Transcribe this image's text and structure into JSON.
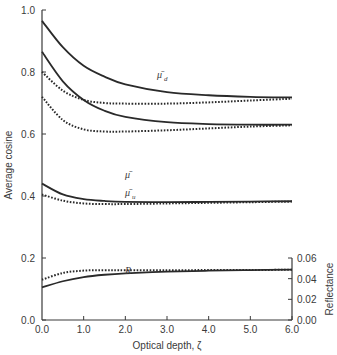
{
  "chart_data": {
    "type": "line",
    "title": "",
    "xlabel": "Optical depth, ζ",
    "ylabel": "Average cosine",
    "y2label": "Reflectance",
    "xlim": [
      0.0,
      6.0
    ],
    "ylim": [
      0.0,
      1.0
    ],
    "y2lim": [
      0.0,
      0.06
    ],
    "grid": false,
    "legend": "none (curves labeled inline)",
    "x_ticks": [
      "0.0",
      "1.0",
      "2.0",
      "3.0",
      "4.0",
      "5.0",
      "6.0"
    ],
    "y_ticks": [
      "0.0",
      "0.2",
      "0.4",
      "0.6",
      "0.8",
      "1.0"
    ],
    "y2_ticks": [
      "0.00",
      "0.02",
      "0.04",
      "0.06"
    ],
    "x": [
      0.0,
      0.5,
      1.0,
      1.5,
      2.0,
      3.0,
      4.0,
      5.0,
      6.0
    ],
    "series": [
      {
        "name": "μ̄d (solid)",
        "axis": "left",
        "style": "solid",
        "values": [
          0.965,
          0.88,
          0.82,
          0.785,
          0.76,
          0.735,
          0.725,
          0.72,
          0.718
        ]
      },
      {
        "name": "μ̄d (dotted)",
        "axis": "left",
        "style": "dotted",
        "values": [
          0.8,
          0.74,
          0.71,
          0.7,
          0.698,
          0.698,
          0.702,
          0.708,
          0.714
        ]
      },
      {
        "name": "μ̄ (solid)",
        "axis": "left",
        "style": "solid",
        "values": [
          0.865,
          0.77,
          0.71,
          0.675,
          0.655,
          0.638,
          0.632,
          0.63,
          0.63
        ]
      },
      {
        "name": "μ̄ (dotted)",
        "axis": "left",
        "style": "dotted",
        "values": [
          0.72,
          0.645,
          0.615,
          0.608,
          0.608,
          0.612,
          0.618,
          0.624,
          0.628
        ]
      },
      {
        "name": "μ̄u (solid)",
        "axis": "left",
        "style": "solid",
        "values": [
          0.44,
          0.405,
          0.39,
          0.384,
          0.381,
          0.38,
          0.381,
          0.382,
          0.383
        ]
      },
      {
        "name": "μ̄u (dotted)",
        "axis": "left",
        "style": "dotted",
        "values": [
          0.405,
          0.385,
          0.376,
          0.374,
          0.374,
          0.376,
          0.378,
          0.38,
          0.382
        ]
      },
      {
        "name": "R (solid)",
        "axis": "right",
        "style": "solid",
        "values": [
          0.0315,
          0.0375,
          0.0415,
          0.0438,
          0.0452,
          0.0468,
          0.0477,
          0.0483,
          0.0488
        ]
      },
      {
        "name": "R (dotted)",
        "axis": "right",
        "style": "dotted",
        "values": [
          0.039,
          0.0455,
          0.0478,
          0.0482,
          0.0482,
          0.0482,
          0.0483,
          0.0484,
          0.0486
        ]
      }
    ],
    "annotations": [
      {
        "text": "μ̄d",
        "x": 2.8,
        "y": 0.83
      },
      {
        "text": "μ̄",
        "x": 2.0,
        "y": 0.565
      },
      {
        "text": "μ̄u",
        "x": 2.0,
        "y": 0.41
      },
      {
        "text": "R",
        "x": 2.0,
        "y": 0.155
      }
    ]
  },
  "labels": {
    "mu_d": "μ̄",
    "mu_d_sub": "d",
    "mu": "μ̄",
    "mu_u": "μ̄",
    "mu_u_sub": "u",
    "R": "R"
  }
}
